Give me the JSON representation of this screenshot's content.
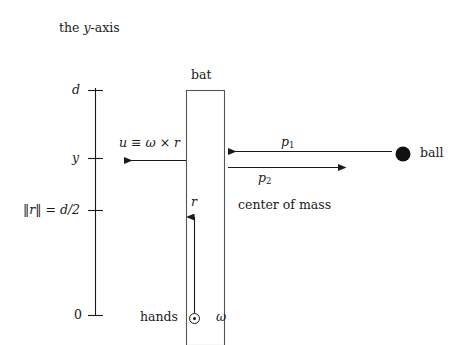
{
  "figure": {
    "type": "physics-diagram",
    "background_color": "#ffffff",
    "stroke_color": "#1a1a1a"
  },
  "axis": {
    "name": "the y-axis",
    "caption": "the y-axis",
    "caption_plain": "the y-axis",
    "caption_prefix": "the ",
    "caption_symbol": "y",
    "caption_suffix": "-axis",
    "ticks": [
      {
        "label": "d",
        "value": "d",
        "kind": "math"
      },
      {
        "label": "y",
        "value": "y",
        "kind": "math"
      },
      {
        "label": "‖r‖ = d/2",
        "value": "d/2",
        "kind": "math"
      },
      {
        "label": "0",
        "value": "0",
        "kind": "upright"
      }
    ]
  },
  "bat": {
    "label": "bat"
  },
  "ball": {
    "label": "ball",
    "color": "#111111"
  },
  "vectors": {
    "u": {
      "label": "u ≡ ω × r",
      "symbol": "u",
      "relation": "≡",
      "expression": "ω × r",
      "direction": "left"
    },
    "p1": {
      "symbol": "p",
      "subscript": "1",
      "label": "p1",
      "direction": "left"
    },
    "p2": {
      "symbol": "p",
      "subscript": "2",
      "label": "p2",
      "direction": "right"
    },
    "r": {
      "label": "r",
      "direction": "up"
    },
    "omega": {
      "label": "ω",
      "symbol": "ω",
      "marker": "⊙",
      "marker_name": "out-of-page-vector"
    }
  },
  "annotations": {
    "center_of_mass": "center of mass",
    "hands": "hands"
  }
}
